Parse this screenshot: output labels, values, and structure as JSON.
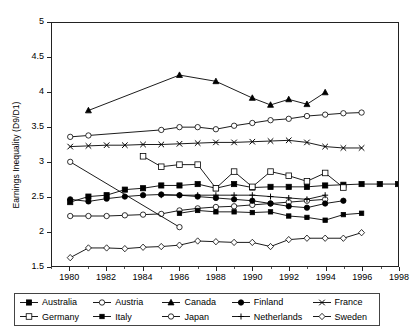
{
  "chart_data": {
    "type": "line",
    "title": "",
    "xlabel": "",
    "ylabel": "Earnings Inequality (D9/D1)",
    "xlim": [
      1979,
      1998
    ],
    "ylim": [
      1.5,
      5
    ],
    "xticks": [
      1980,
      1982,
      1984,
      1986,
      1988,
      1990,
      1992,
      1994,
      1996,
      1998
    ],
    "yticks": [
      1.5,
      2,
      2.5,
      3,
      3.5,
      4,
      4.5,
      5
    ],
    "ytick_labels": [
      "1.5",
      "2",
      "2.5",
      "3",
      "3.5",
      "4",
      "4.5",
      "5"
    ],
    "xtick_labels": [
      "1980",
      "1982",
      "1984",
      "1986",
      "1988",
      "1990",
      "1992",
      "1994",
      "1996",
      "1998"
    ],
    "grid": false,
    "legend_position": "bottom",
    "series": [
      {
        "name": "Australia",
        "marker": "filled-square",
        "x": [
          1980,
          1981,
          1982,
          1983,
          1984,
          1985,
          1986,
          1987,
          1988,
          1989,
          1990,
          1991,
          1992,
          1993,
          1994,
          1995,
          1996,
          1997,
          1998
        ],
        "values": [
          2.42,
          2.5,
          2.52,
          2.6,
          2.62,
          2.66,
          2.66,
          2.68,
          2.62,
          2.68,
          2.63,
          2.64,
          2.64,
          2.64,
          2.66,
          2.67,
          2.68,
          2.68,
          2.68
        ]
      },
      {
        "name": "Austria",
        "marker": "hollow-circle",
        "x": [
          1980,
          1981,
          1982,
          1983,
          1984,
          1985,
          1986,
          1987,
          1988,
          1989,
          1990,
          1991,
          1992,
          1993,
          1994
        ],
        "values": [
          2.22,
          2.22,
          2.22,
          2.23,
          2.24,
          2.25,
          2.3,
          2.33,
          2.35,
          2.36,
          2.38,
          2.4,
          2.42,
          2.44,
          2.46
        ]
      },
      {
        "name": "Canada",
        "marker": "filled-triangle",
        "x": [
          1981,
          1986,
          1988,
          1990,
          1991,
          1992,
          1993,
          1994
        ],
        "values": [
          3.74,
          4.25,
          4.16,
          3.92,
          3.82,
          3.9,
          3.83,
          4.0
        ]
      },
      {
        "name": "Finland",
        "marker": "filled-circle",
        "x": [
          1980,
          1981,
          1982,
          1983,
          1984,
          1985,
          1986,
          1987,
          1988,
          1989,
          1990,
          1991,
          1992,
          1993,
          1994,
          1995
        ],
        "values": [
          2.46,
          2.43,
          2.47,
          2.5,
          2.52,
          2.53,
          2.52,
          2.5,
          2.48,
          2.46,
          2.44,
          2.4,
          2.36,
          2.34,
          2.4,
          2.44
        ]
      },
      {
        "name": "France",
        "marker": "cross-x",
        "x": [
          1980,
          1981,
          1982,
          1983,
          1984,
          1985,
          1986,
          1987,
          1988,
          1989,
          1990,
          1991,
          1992,
          1993,
          1994,
          1995,
          1996
        ],
        "values": [
          3.22,
          3.23,
          3.24,
          3.24,
          3.25,
          3.25,
          3.26,
          3.27,
          3.28,
          3.28,
          3.29,
          3.3,
          3.31,
          3.28,
          3.22,
          3.2,
          3.2
        ]
      },
      {
        "name": "Germany",
        "marker": "hollow-square",
        "x": [
          1984,
          1985,
          1986,
          1987,
          1988,
          1989,
          1990,
          1991,
          1992,
          1993,
          1994,
          1995
        ],
        "values": [
          3.08,
          2.93,
          2.96,
          2.96,
          2.62,
          2.86,
          2.64,
          2.86,
          2.8,
          2.72,
          2.84,
          2.63
        ]
      },
      {
        "name": "Italy",
        "marker": "filled-square-small",
        "x": [
          1986,
          1987,
          1988,
          1989,
          1990,
          1991,
          1992,
          1993,
          1994,
          1995,
          1996
        ],
        "values": [
          2.26,
          2.3,
          2.28,
          2.28,
          2.27,
          2.28,
          2.22,
          2.2,
          2.16,
          2.24,
          2.26
        ]
      },
      {
        "name": "Japan",
        "marker": "hollow-circle-open",
        "x": [
          1980,
          1981,
          1985,
          1986,
          1987,
          1988,
          1989,
          1990,
          1991,
          1992,
          1993,
          1994,
          1995,
          1996
        ],
        "values": [
          3.36,
          3.38,
          3.46,
          3.5,
          3.5,
          3.47,
          3.52,
          3.56,
          3.6,
          3.62,
          3.66,
          3.68,
          3.7,
          3.71
        ]
      },
      {
        "name": "Netherlands",
        "marker": "plus",
        "x": [
          1985,
          1986,
          1987,
          1988,
          1989,
          1990,
          1991,
          1992,
          1993,
          1994
        ],
        "values": [
          2.52,
          2.52,
          2.52,
          2.52,
          2.52,
          2.52,
          2.5,
          2.48,
          2.46,
          2.52
        ]
      },
      {
        "name": "Sweden",
        "marker": "hollow-diamond",
        "x": [
          1980,
          1981,
          1982,
          1983,
          1984,
          1985,
          1986,
          1987,
          1988,
          1989,
          1990,
          1991,
          1992,
          1993,
          1994,
          1995,
          1996
        ],
        "values": [
          1.62,
          1.76,
          1.76,
          1.75,
          1.77,
          1.78,
          1.8,
          1.86,
          1.85,
          1.84,
          1.84,
          1.78,
          1.88,
          1.9,
          1.9,
          1.9,
          1.98
        ]
      },
      {
        "name": "Unlabeled-declining",
        "marker": "hollow-circle",
        "x": [
          1980,
          1986
        ],
        "values": [
          3.0,
          2.06
        ]
      }
    ]
  },
  "legend": {
    "rows": [
      [
        {
          "label": "Australia",
          "marker": "filled-square"
        },
        {
          "label": "Austria",
          "marker": "hollow-circle"
        },
        {
          "label": "Canada",
          "marker": "filled-triangle"
        },
        {
          "label": "Finland",
          "marker": "filled-circle"
        },
        {
          "label": "France",
          "marker": "cross-x"
        }
      ],
      [
        {
          "label": "Germany",
          "marker": "hollow-square"
        },
        {
          "label": "Italy",
          "marker": "filled-square-small"
        },
        {
          "label": "Japan",
          "marker": "hollow-circle-open"
        },
        {
          "label": "Netherlands",
          "marker": "plus"
        },
        {
          "label": "Sweden",
          "marker": "hollow-diamond"
        }
      ]
    ]
  },
  "colors": {
    "line": "#000000",
    "axis": "#222222",
    "frame": "#222222",
    "background": "#ffffff"
  }
}
